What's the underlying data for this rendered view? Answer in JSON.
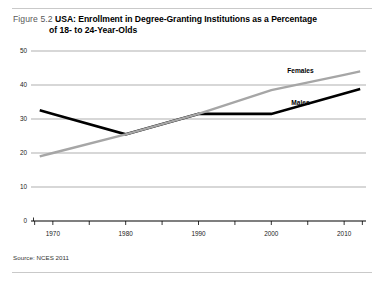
{
  "figure": {
    "number_label": "Figure 5.2",
    "title_line1": "USA: Enrollment in Degree-Granting Institutions as a Percentage",
    "title_line2": "of 18- to 24-Year-Olds",
    "source": "Source: NCES 2011"
  },
  "colors": {
    "males_line": "#000000",
    "females_line": "#a6a6a6",
    "gridline": "#8c8c8c",
    "axis": "#000000",
    "rule": "#c9c9c9",
    "caption_number": "#595959"
  },
  "chart_data": {
    "type": "line",
    "title": "USA: Enrollment in Degree-Granting Institutions as a Percentage of 18- to 24-Year-Olds",
    "xlabel": "",
    "ylabel": "",
    "x": [
      1970,
      1980,
      1990,
      2000,
      2010
    ],
    "categories": [
      "1970",
      "1980",
      "1990",
      "2000",
      "2010"
    ],
    "xlim": [
      1967,
      2013
    ],
    "ylim": [
      0,
      50
    ],
    "yticks": [
      0,
      10,
      20,
      30,
      40,
      50
    ],
    "ytick_labels": [
      "0",
      "10",
      "20",
      "30",
      "40",
      "50"
    ],
    "xtick_labels": [
      "1970",
      "1980",
      "1990",
      "2000",
      "2010"
    ],
    "grid": true,
    "legend_position": "inline-right",
    "series": [
      {
        "name": "Males",
        "color": "#000000",
        "values": [
          31.5,
          25.5,
          31.5,
          31.5,
          37.5
        ]
      },
      {
        "name": "Females",
        "color": "#a6a6a6",
        "values": [
          20.0,
          25.5,
          31.5,
          38.5,
          43.0
        ]
      }
    ],
    "annotations": [
      {
        "text": "Females",
        "x": 2004,
        "y": 43.5
      },
      {
        "text": "Males",
        "x": 2004,
        "y": 34.0
      }
    ]
  }
}
